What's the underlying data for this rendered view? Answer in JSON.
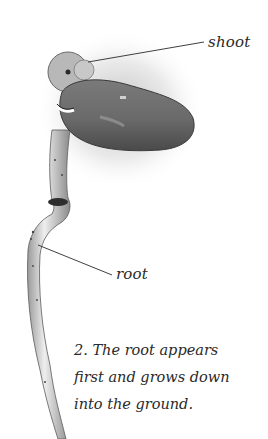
{
  "diagram": {
    "labels": [
      {
        "id": "shoot",
        "text": "shoot"
      },
      {
        "id": "root",
        "text": "root"
      }
    ],
    "caption": {
      "lines": [
        "2. The root appears",
        "first and grows down",
        "into the ground."
      ]
    },
    "colors": {
      "background": "#ffffff",
      "seed": "#6e6e6e",
      "root": "#d8d8d8",
      "text": "#2a2a2a"
    }
  }
}
